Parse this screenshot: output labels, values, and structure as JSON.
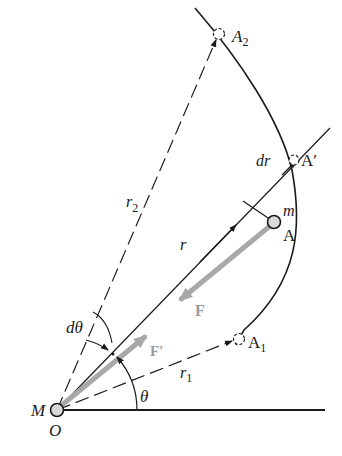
{
  "diagram": {
    "colors": {
      "line": "#1a1a1a",
      "force_vector": "#a8a8a8",
      "particle_fill": "#d8d8d8",
      "background": "#ffffff"
    },
    "points": {
      "origin_mass": "M",
      "origin": "O",
      "particle_mass": "m",
      "particle_position": "A",
      "displaced_position": "A′",
      "position_1": "A",
      "position_1_sub": "1",
      "position_2": "A",
      "position_2_sub": "2"
    },
    "vectors": {
      "radius": "r",
      "radius_1": "r",
      "radius_1_sub": "1",
      "radius_2": "r",
      "radius_2_sub": "2",
      "radial_increment": "dr",
      "force_on_particle": "F",
      "reaction_force": "F′"
    },
    "angles": {
      "polar_angle": "θ",
      "angle_increment": "dθ"
    }
  }
}
